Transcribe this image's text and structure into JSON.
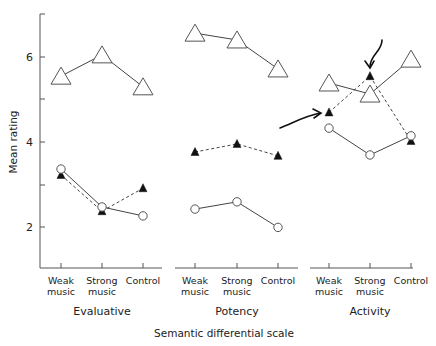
{
  "chart_data": {
    "type": "line",
    "title": "",
    "ylabel": "Mean rating",
    "xlabel": "Semantic differential scale",
    "ylim": [
      1,
      7
    ],
    "yticks": [
      2,
      4,
      6
    ],
    "yticks_minor": [
      3,
      5,
      7
    ],
    "grid": false,
    "legend": "none",
    "categories": [
      "Weak music",
      "Strong music",
      "Control"
    ],
    "category_lines": [
      [
        "Weak",
        "music"
      ],
      [
        "Strong",
        "music"
      ],
      [
        "Control"
      ]
    ],
    "panels": [
      {
        "name": "Evaluative",
        "series": [
          {
            "name": "open-triangle-large",
            "marker": "open-triangle",
            "line": "solid",
            "values": [
              5.55,
              6.05,
              5.3
            ]
          },
          {
            "name": "filled-triangle",
            "marker": "filled-triangle",
            "line": "dashed",
            "values": [
              3.23,
              2.38,
              2.92
            ]
          },
          {
            "name": "open-circle",
            "marker": "open-circle",
            "line": "solid",
            "values": [
              3.37,
              2.48,
              2.27
            ]
          }
        ]
      },
      {
        "name": "Potency",
        "series": [
          {
            "name": "open-triangle-large",
            "marker": "open-triangle",
            "line": "solid",
            "values": [
              6.56,
              6.4,
              5.72
            ]
          },
          {
            "name": "filled-triangle",
            "marker": "filled-triangle",
            "line": "dashed",
            "values": [
              3.77,
              3.96,
              3.68
            ]
          },
          {
            "name": "open-circle",
            "marker": "open-circle",
            "line": "solid",
            "values": [
              2.43,
              2.6,
              2.0
            ]
          }
        ]
      },
      {
        "name": "Activity",
        "series": [
          {
            "name": "open-triangle-large",
            "marker": "open-triangle",
            "line": "solid",
            "values": [
              5.39,
              5.13,
              5.95
            ]
          },
          {
            "name": "filled-triangle",
            "marker": "filled-triangle",
            "line": "dashed",
            "values": [
              4.7,
              5.55,
              4.03
            ]
          },
          {
            "name": "open-circle",
            "marker": "open-circle",
            "line": "solid",
            "values": [
              4.33,
              3.7,
              4.15
            ]
          }
        ]
      }
    ],
    "annotations": [
      {
        "type": "arrow",
        "panel": "Activity",
        "target": "filled-triangle Weak music",
        "direction": "right"
      },
      {
        "type": "arrow",
        "panel": "Activity",
        "target": "filled-triangle Strong music",
        "direction": "down"
      }
    ]
  },
  "labels": {
    "ylabel": "Mean rating",
    "xlabel": "Semantic differential scale",
    "ytick_2": "2",
    "ytick_4": "4",
    "ytick_6": "6",
    "panel_0": "Evaluative",
    "panel_1": "Potency",
    "panel_2": "Activity"
  },
  "colors": {
    "ink": "#222222",
    "axis": "#555555",
    "line": "#444444"
  }
}
